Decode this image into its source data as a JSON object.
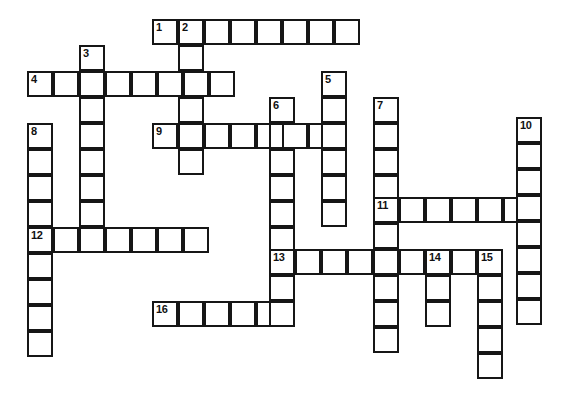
{
  "puzzle": {
    "type": "crossword-grid",
    "title": "Crossword puzzle grid",
    "cell_size": 26,
    "line_color": "#161616",
    "cell_fill": "#ffffff",
    "background": "#ffffff",
    "numbered_clues": [
      1,
      2,
      3,
      4,
      5,
      6,
      7,
      8,
      9,
      10,
      11,
      12,
      13,
      14,
      15,
      16
    ],
    "entries": [
      {
        "number": 1,
        "direction": "across",
        "x": 152,
        "y": 19,
        "length": 8,
        "label": "1"
      },
      {
        "number": 2,
        "direction": "down",
        "x": 178,
        "y": 19,
        "length": 7,
        "label": "2"
      },
      {
        "number": 3,
        "direction": "down",
        "x": 79,
        "y": 45,
        "length": 8,
        "label": "3"
      },
      {
        "number": 4,
        "direction": "across",
        "x": 27,
        "y": 71,
        "length": 8,
        "label": "4"
      },
      {
        "number": 5,
        "direction": "down",
        "x": 321,
        "y": 71,
        "length": 6,
        "label": "5"
      },
      {
        "number": 6,
        "direction": "down",
        "x": 269,
        "y": 97,
        "length": 9,
        "label": "6"
      },
      {
        "number": 7,
        "direction": "down",
        "x": 373,
        "y": 97,
        "length": 10,
        "label": "7"
      },
      {
        "number": 8,
        "direction": "down",
        "x": 27,
        "y": 123,
        "length": 9,
        "label": "8"
      },
      {
        "number": 9,
        "direction": "across",
        "x": 152,
        "y": 123,
        "length": 7,
        "label": "9"
      },
      {
        "number": 10,
        "direction": "down",
        "x": 516,
        "y": 117,
        "length": 8,
        "label": "10"
      },
      {
        "number": 11,
        "direction": "across",
        "x": 373,
        "y": 197,
        "length": 6,
        "label": "11"
      },
      {
        "number": 12,
        "direction": "across",
        "x": 27,
        "y": 227,
        "length": 7,
        "label": "12"
      },
      {
        "number": 13,
        "direction": "across",
        "x": 269,
        "y": 249,
        "length": 9,
        "label": "13"
      },
      {
        "number": 14,
        "direction": "down",
        "x": 425,
        "y": 249,
        "length": 3,
        "label": "14"
      },
      {
        "number": 15,
        "direction": "down",
        "x": 477,
        "y": 249,
        "length": 5,
        "label": "15"
      },
      {
        "number": 16,
        "direction": "across",
        "x": 152,
        "y": 301,
        "length": 6,
        "label": "16"
      }
    ],
    "cells": [
      {
        "x": 152,
        "y": 19,
        "num": "1"
      },
      {
        "x": 178,
        "y": 19,
        "num": "2"
      },
      {
        "x": 204,
        "y": 19,
        "num": ""
      },
      {
        "x": 230,
        "y": 19,
        "num": ""
      },
      {
        "x": 256,
        "y": 19,
        "num": ""
      },
      {
        "x": 282,
        "y": 19,
        "num": ""
      },
      {
        "x": 308,
        "y": 19,
        "num": ""
      },
      {
        "x": 334,
        "y": 19,
        "num": ""
      },
      {
        "x": 79,
        "y": 45,
        "num": "3"
      },
      {
        "x": 178,
        "y": 45,
        "num": ""
      },
      {
        "x": 27,
        "y": 71,
        "num": "4"
      },
      {
        "x": 53,
        "y": 71,
        "num": ""
      },
      {
        "x": 79,
        "y": 71,
        "num": ""
      },
      {
        "x": 105,
        "y": 71,
        "num": ""
      },
      {
        "x": 131,
        "y": 71,
        "num": ""
      },
      {
        "x": 157,
        "y": 71,
        "num": ""
      },
      {
        "x": 183,
        "y": 71,
        "num": ""
      },
      {
        "x": 209,
        "y": 71,
        "num": ""
      },
      {
        "x": 321,
        "y": 71,
        "num": "5"
      },
      {
        "x": 79,
        "y": 97,
        "num": ""
      },
      {
        "x": 178,
        "y": 97,
        "num": ""
      },
      {
        "x": 269,
        "y": 97,
        "num": "6"
      },
      {
        "x": 321,
        "y": 97,
        "num": ""
      },
      {
        "x": 373,
        "y": 97,
        "num": "7"
      },
      {
        "x": 516,
        "y": 117,
        "num": "10"
      },
      {
        "x": 27,
        "y": 123,
        "num": "8"
      },
      {
        "x": 79,
        "y": 123,
        "num": ""
      },
      {
        "x": 152,
        "y": 123,
        "num": "9"
      },
      {
        "x": 178,
        "y": 123,
        "num": ""
      },
      {
        "x": 204,
        "y": 123,
        "num": ""
      },
      {
        "x": 230,
        "y": 123,
        "num": ""
      },
      {
        "x": 256,
        "y": 123,
        "num": ""
      },
      {
        "x": 269,
        "y": 123,
        "num": ""
      },
      {
        "x": 282,
        "y": 123,
        "num": ""
      },
      {
        "x": 308,
        "y": 123,
        "num": ""
      },
      {
        "x": 321,
        "y": 123,
        "num": ""
      },
      {
        "x": 373,
        "y": 123,
        "num": ""
      },
      {
        "x": 516,
        "y": 143,
        "num": ""
      },
      {
        "x": 27,
        "y": 149,
        "num": ""
      },
      {
        "x": 79,
        "y": 149,
        "num": ""
      },
      {
        "x": 178,
        "y": 149,
        "num": ""
      },
      {
        "x": 269,
        "y": 149,
        "num": ""
      },
      {
        "x": 321,
        "y": 149,
        "num": ""
      },
      {
        "x": 373,
        "y": 149,
        "num": ""
      },
      {
        "x": 516,
        "y": 169,
        "num": ""
      },
      {
        "x": 27,
        "y": 175,
        "num": ""
      },
      {
        "x": 79,
        "y": 175,
        "num": ""
      },
      {
        "x": 269,
        "y": 175,
        "num": ""
      },
      {
        "x": 321,
        "y": 175,
        "num": ""
      },
      {
        "x": 373,
        "y": 175,
        "num": ""
      },
      {
        "x": 27,
        "y": 201,
        "num": ""
      },
      {
        "x": 79,
        "y": 201,
        "num": ""
      },
      {
        "x": 269,
        "y": 201,
        "num": ""
      },
      {
        "x": 321,
        "y": 201,
        "num": ""
      },
      {
        "x": 373,
        "y": 197,
        "num": "11"
      },
      {
        "x": 399,
        "y": 197,
        "num": ""
      },
      {
        "x": 425,
        "y": 197,
        "num": ""
      },
      {
        "x": 451,
        "y": 197,
        "num": ""
      },
      {
        "x": 477,
        "y": 197,
        "num": ""
      },
      {
        "x": 503,
        "y": 197,
        "num": ""
      },
      {
        "x": 516,
        "y": 195,
        "num": ""
      },
      {
        "x": 27,
        "y": 227,
        "num": "12"
      },
      {
        "x": 53,
        "y": 227,
        "num": ""
      },
      {
        "x": 79,
        "y": 227,
        "num": ""
      },
      {
        "x": 105,
        "y": 227,
        "num": ""
      },
      {
        "x": 131,
        "y": 227,
        "num": ""
      },
      {
        "x": 157,
        "y": 227,
        "num": ""
      },
      {
        "x": 183,
        "y": 227,
        "num": ""
      },
      {
        "x": 269,
        "y": 227,
        "num": ""
      },
      {
        "x": 373,
        "y": 223,
        "num": ""
      },
      {
        "x": 516,
        "y": 221,
        "num": ""
      },
      {
        "x": 269,
        "y": 249,
        "num": "13"
      },
      {
        "x": 295,
        "y": 249,
        "num": ""
      },
      {
        "x": 321,
        "y": 249,
        "num": ""
      },
      {
        "x": 347,
        "y": 249,
        "num": ""
      },
      {
        "x": 373,
        "y": 249,
        "num": ""
      },
      {
        "x": 399,
        "y": 249,
        "num": ""
      },
      {
        "x": 425,
        "y": 249,
        "num": "14"
      },
      {
        "x": 451,
        "y": 249,
        "num": ""
      },
      {
        "x": 477,
        "y": 249,
        "num": "15"
      },
      {
        "x": 27,
        "y": 253,
        "num": ""
      },
      {
        "x": 516,
        "y": 247,
        "num": ""
      },
      {
        "x": 269,
        "y": 275,
        "num": ""
      },
      {
        "x": 373,
        "y": 275,
        "num": ""
      },
      {
        "x": 425,
        "y": 275,
        "num": ""
      },
      {
        "x": 477,
        "y": 275,
        "num": ""
      },
      {
        "x": 27,
        "y": 279,
        "num": ""
      },
      {
        "x": 516,
        "y": 273,
        "num": ""
      },
      {
        "x": 152,
        "y": 301,
        "num": "16"
      },
      {
        "x": 178,
        "y": 301,
        "num": ""
      },
      {
        "x": 204,
        "y": 301,
        "num": ""
      },
      {
        "x": 230,
        "y": 301,
        "num": ""
      },
      {
        "x": 256,
        "y": 301,
        "num": ""
      },
      {
        "x": 269,
        "y": 301,
        "num": ""
      },
      {
        "x": 373,
        "y": 301,
        "num": ""
      },
      {
        "x": 425,
        "y": 301,
        "num": ""
      },
      {
        "x": 477,
        "y": 301,
        "num": ""
      },
      {
        "x": 27,
        "y": 305,
        "num": ""
      },
      {
        "x": 516,
        "y": 299,
        "num": ""
      },
      {
        "x": 373,
        "y": 327,
        "num": ""
      },
      {
        "x": 477,
        "y": 327,
        "num": ""
      },
      {
        "x": 27,
        "y": 331,
        "num": ""
      },
      {
        "x": 477,
        "y": 353,
        "num": ""
      }
    ]
  }
}
